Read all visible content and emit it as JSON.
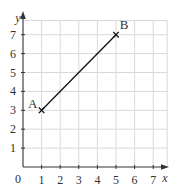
{
  "chart_data": {
    "type": "line",
    "title": "",
    "xlabel": "x",
    "ylabel": "y",
    "xlim": [
      0,
      7.8
    ],
    "ylim": [
      0,
      7.8
    ],
    "grid": true,
    "origin_label": "0",
    "x_ticks": [
      1,
      2,
      3,
      4,
      5,
      6,
      7
    ],
    "y_ticks": [
      1,
      2,
      3,
      4,
      5,
      6,
      7
    ],
    "points": [
      {
        "label": "A",
        "x": 1,
        "y": 3
      },
      {
        "label": "B",
        "x": 5,
        "y": 7
      }
    ],
    "segment": {
      "from": "A",
      "to": "B"
    }
  },
  "colors": {
    "grid": "#d9d9d9",
    "axis": "#333333",
    "line": "#111111",
    "text": "#333333"
  }
}
